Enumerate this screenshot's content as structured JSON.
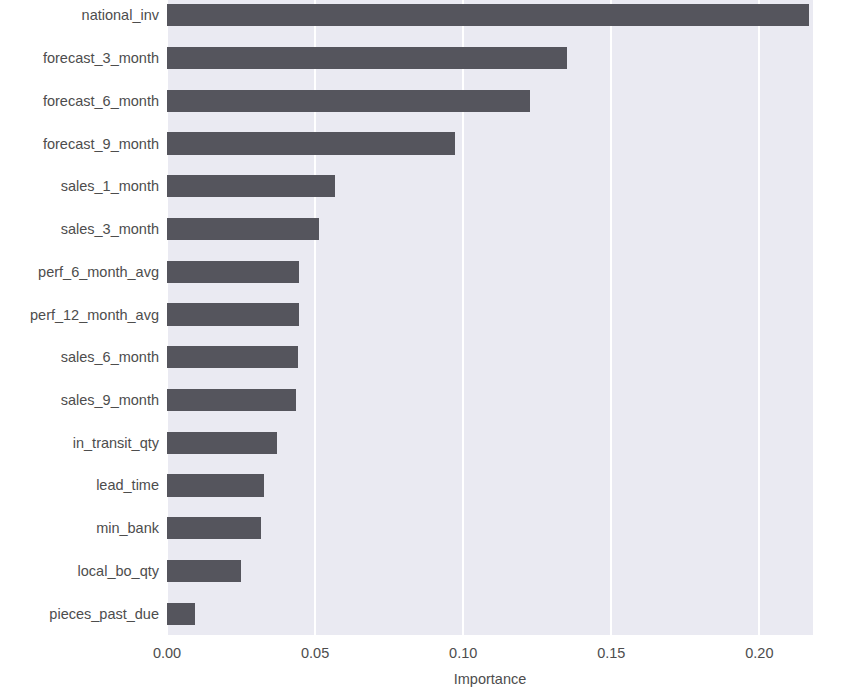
{
  "chart_data": {
    "type": "bar",
    "orientation": "horizontal",
    "title": "Feature Importance",
    "xlabel": "Importance",
    "ylabel": "",
    "xlim": [
      0.0,
      0.2181
    ],
    "xticks": [
      0.0,
      0.05,
      0.1,
      0.15,
      0.2
    ],
    "xtick_labels": [
      "0.00",
      "0.05",
      "0.10",
      "0.15",
      "0.20"
    ],
    "grid": true,
    "grid_axis": "x",
    "legend": null,
    "categories": [
      "national_inv",
      "forecast_3_month",
      "forecast_6_month",
      "forecast_9_month",
      "sales_1_month",
      "sales_3_month",
      "perf_6_month_avg",
      "perf_12_month_avg",
      "sales_6_month",
      "sales_9_month",
      "in_transit_qty",
      "lead_time",
      "min_bank",
      "local_bo_qty",
      "pieces_past_due"
    ],
    "values": [
      0.2166,
      0.1352,
      0.1227,
      0.0972,
      0.0567,
      0.0513,
      0.0446,
      0.0444,
      0.0441,
      0.0437,
      0.0373,
      0.0329,
      0.0318,
      0.025,
      0.0094
    ],
    "colors": {
      "bar": "#55555d",
      "plot_background": "#eaeaf2",
      "figure_background": "#ffffff",
      "gridline": "#ffffff",
      "tick_label": "#4d4d4d",
      "title": "#3b3b3b"
    }
  }
}
